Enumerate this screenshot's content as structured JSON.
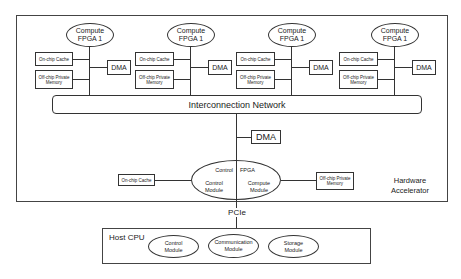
{
  "accelerator": {
    "label_line1": "Hardware",
    "label_line2": "Accelerator",
    "nodes": [
      {
        "fpga_line1": "Compute",
        "fpga_line2": "FPGA 1",
        "cache": "On-chip Cache",
        "mem_line1": "Off-chip Private",
        "mem_line2": "Memory",
        "dma": "DMA"
      },
      {
        "fpga_line1": "Compute",
        "fpga_line2": "FPGA 1",
        "cache": "On-chip Cache",
        "mem_line1": "Off-chip Private",
        "mem_line2": "Memory",
        "dma": "DMA"
      },
      {
        "fpga_line1": "Compute",
        "fpga_line2": "FPGA 1",
        "cache": "On-chip Cache",
        "mem_line1": "Off-chip Private",
        "mem_line2": "Memory",
        "dma": "DMA"
      },
      {
        "fpga_line1": "Compute",
        "fpga_line2": "FPGA 1",
        "cache": "On-chip Cache",
        "mem_line1": "Off-chip Private",
        "mem_line2": "Memory",
        "dma": "DMA"
      }
    ],
    "interconnect": "Interconnection Network",
    "central_dma": "DMA",
    "control_fpga": {
      "left_top": "Control",
      "right_top": "FPGA",
      "left_line1": "Control",
      "left_line2": "Module",
      "right_line1": "Compute",
      "right_line2": "Module"
    },
    "central_cache": "On-chip Cache",
    "central_mem_line1": "Off-chip Private",
    "central_mem_line2": "Memory"
  },
  "link": "PCIe",
  "host": {
    "title": "Host CPU",
    "modules": [
      {
        "line1": "Control",
        "line2": "Module"
      },
      {
        "line1": "Communication",
        "line2": "Module"
      },
      {
        "line1": "Storage",
        "line2": "Module"
      }
    ]
  }
}
